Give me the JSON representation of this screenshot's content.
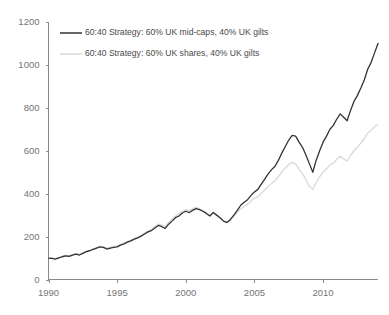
{
  "chart_data": {
    "type": "line",
    "title": "",
    "subtitle": "",
    "xlabel": "",
    "ylabel": "",
    "xlim": [
      1990,
      2014
    ],
    "ylim": [
      0,
      1200
    ],
    "grid": false,
    "legend_position": "top-left",
    "xticks": [
      1990,
      1995,
      2000,
      2005,
      2010
    ],
    "xtick_labels": [
      "1990",
      "1995",
      "2000",
      "2005",
      "2010"
    ],
    "yticks": [
      0,
      200,
      400,
      600,
      800,
      1000,
      1200
    ],
    "ytick_labels": [
      "0",
      "200",
      "400",
      "600",
      "800",
      "1000",
      "1200"
    ],
    "series": [
      {
        "name": "60:40 Strategy: 60% UK mid-caps, 40% UK gilts",
        "color": "#333333",
        "width": 1.3,
        "x": [
          1990.0,
          1990.25,
          1990.5,
          1990.75,
          1991.0,
          1991.25,
          1991.5,
          1991.75,
          1992.0,
          1992.25,
          1992.5,
          1992.75,
          1993.0,
          1993.25,
          1993.5,
          1993.75,
          1994.0,
          1994.25,
          1994.5,
          1994.75,
          1995.0,
          1995.25,
          1995.5,
          1995.75,
          1996.0,
          1996.25,
          1996.5,
          1996.75,
          1997.0,
          1997.25,
          1997.5,
          1997.75,
          1998.0,
          1998.25,
          1998.5,
          1998.75,
          1999.0,
          1999.25,
          1999.5,
          1999.75,
          2000.0,
          2000.25,
          2000.5,
          2000.75,
          2001.0,
          2001.25,
          2001.5,
          2001.75,
          2002.0,
          2002.25,
          2002.5,
          2002.75,
          2003.0,
          2003.25,
          2003.5,
          2003.75,
          2004.0,
          2004.25,
          2004.5,
          2004.75,
          2005.0,
          2005.25,
          2005.5,
          2005.75,
          2006.0,
          2006.25,
          2006.5,
          2006.75,
          2007.0,
          2007.25,
          2007.5,
          2007.75,
          2008.0,
          2008.25,
          2008.5,
          2008.75,
          2009.0,
          2009.25,
          2009.5,
          2009.75,
          2010.0,
          2010.25,
          2010.5,
          2010.75,
          2011.0,
          2011.25,
          2011.5,
          2011.75,
          2012.0,
          2012.25,
          2012.5,
          2012.75,
          2013.0,
          2013.25,
          2013.5,
          2013.75,
          2014.0
        ],
        "values": [
          100,
          98,
          95,
          101,
          106,
          110,
          108,
          114,
          118,
          114,
          122,
          130,
          134,
          140,
          146,
          152,
          150,
          142,
          146,
          150,
          152,
          160,
          166,
          174,
          180,
          188,
          194,
          202,
          212,
          222,
          228,
          240,
          252,
          246,
          238,
          258,
          272,
          288,
          296,
          310,
          318,
          312,
          322,
          330,
          326,
          318,
          308,
          296,
          312,
          300,
          288,
          272,
          266,
          280,
          300,
          322,
          346,
          360,
          372,
          392,
          408,
          420,
          444,
          468,
          492,
          512,
          528,
          556,
          590,
          620,
          650,
          672,
          668,
          640,
          616,
          580,
          540,
          500,
          556,
          600,
          640,
          668,
          700,
          718,
          748,
          772,
          756,
          740,
          788,
          830,
          858,
          892,
          930,
          980,
          1012,
          1056,
          1100
        ]
      },
      {
        "name": "60:40 Strategy: 60% UK shares, 40% UK gilts",
        "color": "#d9d9d9",
        "width": 1.3,
        "x": [
          1990.0,
          1990.25,
          1990.5,
          1990.75,
          1991.0,
          1991.25,
          1991.5,
          1991.75,
          1992.0,
          1992.25,
          1992.5,
          1992.75,
          1993.0,
          1993.25,
          1993.5,
          1993.75,
          1994.0,
          1994.25,
          1994.5,
          1994.75,
          1995.0,
          1995.25,
          1995.5,
          1995.75,
          1996.0,
          1996.25,
          1996.5,
          1996.75,
          1997.0,
          1997.25,
          1997.5,
          1997.75,
          1998.0,
          1998.25,
          1998.5,
          1998.75,
          1999.0,
          1999.25,
          1999.5,
          1999.75,
          2000.0,
          2000.25,
          2000.5,
          2000.75,
          2001.0,
          2001.25,
          2001.5,
          2001.75,
          2002.0,
          2002.25,
          2002.5,
          2002.75,
          2003.0,
          2003.25,
          2003.5,
          2003.75,
          2004.0,
          2004.25,
          2004.5,
          2004.75,
          2005.0,
          2005.25,
          2005.5,
          2005.75,
          2006.0,
          2006.25,
          2006.5,
          2006.75,
          2007.0,
          2007.25,
          2007.5,
          2007.75,
          2008.0,
          2008.25,
          2008.5,
          2008.75,
          2009.0,
          2009.25,
          2009.5,
          2009.75,
          2010.0,
          2010.25,
          2010.5,
          2010.75,
          2011.0,
          2011.25,
          2011.5,
          2011.75,
          2012.0,
          2012.25,
          2012.5,
          2012.75,
          2013.0,
          2013.25,
          2013.5,
          2013.75,
          2014.0
        ],
        "values": [
          100,
          99,
          97,
          103,
          108,
          112,
          111,
          116,
          120,
          117,
          124,
          131,
          136,
          142,
          148,
          154,
          152,
          146,
          150,
          154,
          157,
          164,
          170,
          178,
          184,
          192,
          198,
          206,
          216,
          226,
          234,
          246,
          258,
          254,
          248,
          266,
          282,
          296,
          306,
          318,
          326,
          322,
          330,
          336,
          330,
          320,
          310,
          298,
          310,
          298,
          286,
          270,
          264,
          276,
          294,
          312,
          330,
          340,
          350,
          366,
          378,
          386,
          402,
          418,
          434,
          448,
          460,
          480,
          502,
          520,
          536,
          546,
          538,
          514,
          492,
          466,
          434,
          420,
          452,
          478,
          500,
          516,
          534,
          542,
          560,
          574,
          562,
          552,
          578,
          600,
          616,
          636,
          656,
          682,
          696,
          712,
          722
        ]
      }
    ]
  },
  "legend": {
    "entries": [
      {
        "label": "60:40 Strategy: 60% UK mid-caps, 40% UK gilts",
        "swatch_color": "#333333"
      },
      {
        "label": "60:40 Strategy: 60% UK shares, 40% UK gilts",
        "swatch_color": "#d9d9d9"
      }
    ]
  },
  "axes": {
    "axis_color": "#8a8a8a",
    "label_color": "#757575"
  }
}
